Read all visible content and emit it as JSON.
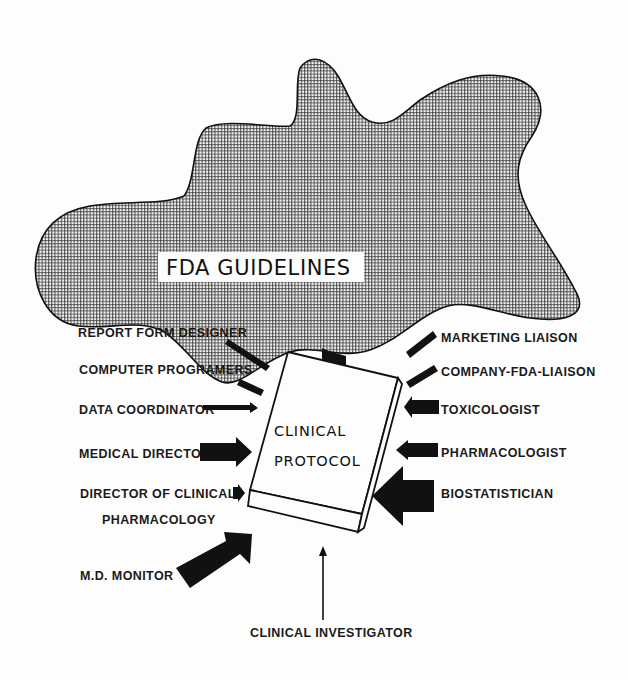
{
  "diagram": {
    "title": "FDA GUIDELINES",
    "center": {
      "line1": "CLINICAL",
      "line2": "PROTOCOL"
    },
    "left_contributors": [
      {
        "label": "REPORT FORM DESIGNER",
        "arrow": "thin-diagonal"
      },
      {
        "label": "COMPUTER PROGRAMERS",
        "arrow": "thin-diagonal"
      },
      {
        "label": "DATA COORDINATOR",
        "arrow": "thin-horizontal"
      },
      {
        "label": "MEDICAL DIRECTOR",
        "arrow": "thick-horizontal"
      },
      {
        "label_line1": "DIRECTOR OF CLINICAL",
        "label_line2": "PHARMACOLOGY",
        "arrow": "small-horizontal"
      },
      {
        "label": "M.D. MONITOR",
        "arrow": "thick-diagonal"
      }
    ],
    "right_contributors": [
      {
        "label": "MARKETING LIAISON",
        "arrow": "thin-diagonal"
      },
      {
        "label": "COMPANY-FDA-LIAISON",
        "arrow": "thin-diagonal"
      },
      {
        "label": "TOXICOLOGIST",
        "arrow": "medium-horizontal"
      },
      {
        "label": "PHARMACOLOGIST",
        "arrow": "medium-horizontal"
      },
      {
        "label": "BIOSTATISTICIAN",
        "arrow": "large-horizontal"
      }
    ],
    "bottom_contributor": {
      "label": "CLINICAL INVESTIGATOR",
      "arrow": "thin-vertical"
    },
    "top_arrow": "large-down-from-guidelines",
    "colors": {
      "ink": "#111111",
      "paper": "#fdfdfd"
    }
  }
}
